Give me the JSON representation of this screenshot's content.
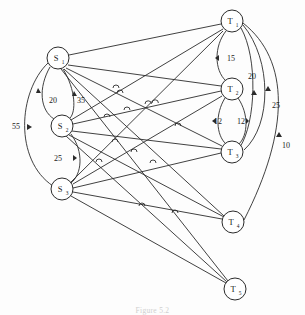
{
  "figure": {
    "caption": "Figure 5.2",
    "background_color": "#fdfdfd",
    "ink_color": "#2b2b2b"
  },
  "nodes": [
    {
      "id": "S1",
      "label": "S",
      "sub": "1",
      "x": 58,
      "y": 58,
      "r": 11
    },
    {
      "id": "S2",
      "label": "S",
      "sub": "2",
      "x": 62,
      "y": 126,
      "r": 11
    },
    {
      "id": "S3",
      "label": "S",
      "sub": "3",
      "x": 62,
      "y": 189,
      "r": 11
    },
    {
      "id": "T1",
      "label": "T",
      "sub": "1",
      "x": 232,
      "y": 21,
      "r": 11
    },
    {
      "id": "T2",
      "label": "T",
      "sub": "2",
      "x": 232,
      "y": 89,
      "r": 11
    },
    {
      "id": "T3",
      "label": "T",
      "sub": "3",
      "x": 232,
      "y": 152,
      "r": 11
    },
    {
      "id": "T4",
      "label": "T",
      "sub": "4",
      "x": 233,
      "y": 222,
      "r": 11
    },
    {
      "id": "T5",
      "label": "T",
      "sub": "5",
      "x": 235,
      "y": 289,
      "r": 11
    }
  ],
  "edge_labels": [
    {
      "text": "20",
      "x": 53,
      "y": 100
    },
    {
      "text": "35",
      "x": 80,
      "y": 100
    },
    {
      "text": "55",
      "x": 18,
      "y": 126
    },
    {
      "text": "25",
      "x": 57,
      "y": 158
    },
    {
      "text": "15",
      "x": 231,
      "y": 58
    },
    {
      "text": "20",
      "x": 251,
      "y": 76
    },
    {
      "text": "12",
      "x": 218,
      "y": 121
    },
    {
      "text": "12",
      "x": 241,
      "y": 121
    },
    {
      "text": "25",
      "x": 275,
      "y": 105
    },
    {
      "text": "10",
      "x": 285,
      "y": 145
    }
  ],
  "source_nodes": [
    "S1",
    "S2",
    "S3"
  ],
  "sink_nodes": [
    "T1",
    "T2",
    "T3",
    "T4",
    "T5"
  ],
  "bipartite_edges": [
    {
      "from": "S1",
      "to": "T1"
    },
    {
      "from": "S1",
      "to": "T2"
    },
    {
      "from": "S1",
      "to": "T3"
    },
    {
      "from": "S1",
      "to": "T4"
    },
    {
      "from": "S1",
      "to": "T5"
    },
    {
      "from": "S2",
      "to": "T1"
    },
    {
      "from": "S2",
      "to": "T2"
    },
    {
      "from": "S2",
      "to": "T3"
    },
    {
      "from": "S2",
      "to": "T4"
    },
    {
      "from": "S2",
      "to": "T5"
    },
    {
      "from": "S3",
      "to": "T1"
    },
    {
      "from": "S3",
      "to": "T2"
    },
    {
      "from": "S3",
      "to": "T3"
    },
    {
      "from": "S3",
      "to": "T4"
    },
    {
      "from": "S3",
      "to": "T5"
    }
  ],
  "source_chain_edges": [
    {
      "from": "S1",
      "to": "S2",
      "label": "20",
      "side": "left"
    },
    {
      "from": "S1",
      "to": "S2",
      "label": "35",
      "side": "right"
    },
    {
      "from": "S1",
      "to": "S3",
      "label": "55",
      "side": "far-left"
    },
    {
      "from": "S2",
      "to": "S3",
      "label": "25",
      "side": "right"
    }
  ],
  "sink_chain_edges": [
    {
      "from": "T1",
      "to": "T2",
      "label": "15"
    },
    {
      "from": "T1",
      "to": "T3",
      "label": "20"
    },
    {
      "from": "T1",
      "to": "T4",
      "label": "25"
    },
    {
      "from": "T1",
      "to": "T5",
      "label": "10"
    },
    {
      "from": "T2",
      "to": "T3",
      "label": "12",
      "side": "left"
    },
    {
      "from": "T2",
      "to": "T3",
      "label": "12",
      "side": "right"
    }
  ]
}
